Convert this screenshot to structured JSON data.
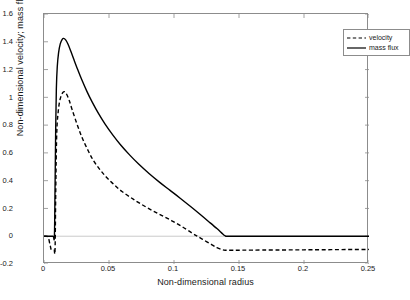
{
  "chart_data": {
    "type": "line",
    "title": "",
    "xlabel": "Non-dimensional radius",
    "ylabel": "Non-dimensional velocity; mass flux",
    "xlim": [
      0,
      0.25
    ],
    "ylim": [
      -0.2,
      1.6
    ],
    "xticks": [
      "0",
      "0.05",
      "0.1",
      "0.15",
      "0.2",
      "0.25"
    ],
    "xtick_values": [
      0,
      0.05,
      0.1,
      0.15,
      0.2,
      0.25
    ],
    "yticks": [
      "1.6",
      "1.4",
      "1.2",
      "1",
      "0.8",
      "0.6",
      "0.4",
      "0.2",
      "0",
      "-0.2"
    ],
    "ytick_values": [
      1.6,
      1.4,
      1.2,
      1,
      0.8,
      0.6,
      0.4,
      0.2,
      0,
      -0.2
    ],
    "grid": false,
    "legend_position": "top-right",
    "series": [
      {
        "name": "velocity",
        "style": "dashed",
        "color": "#000000",
        "points": [
          [
            0.0,
            0.0
          ],
          [
            0.003,
            -0.005
          ],
          [
            0.0045,
            -0.055
          ],
          [
            0.0055,
            -0.095
          ],
          [
            0.0065,
            -0.1
          ],
          [
            0.0078,
            -0.1
          ],
          [
            0.0085,
            -0.098
          ],
          [
            0.009,
            0.3
          ],
          [
            0.0095,
            0.62
          ],
          [
            0.01,
            0.79
          ],
          [
            0.0108,
            0.885
          ],
          [
            0.0118,
            0.96
          ],
          [
            0.013,
            1.005
          ],
          [
            0.0145,
            1.035
          ],
          [
            0.016,
            1.04
          ],
          [
            0.0175,
            1.02
          ],
          [
            0.0195,
            0.975
          ],
          [
            0.0215,
            0.915
          ],
          [
            0.024,
            0.845
          ],
          [
            0.027,
            0.765
          ],
          [
            0.03,
            0.695
          ],
          [
            0.034,
            0.615
          ],
          [
            0.038,
            0.545
          ],
          [
            0.043,
            0.48
          ],
          [
            0.048,
            0.425
          ],
          [
            0.054,
            0.37
          ],
          [
            0.06,
            0.322
          ],
          [
            0.067,
            0.277
          ],
          [
            0.074,
            0.235
          ],
          [
            0.082,
            0.192
          ],
          [
            0.09,
            0.152
          ],
          [
            0.098,
            0.113
          ],
          [
            0.106,
            0.07
          ],
          [
            0.114,
            0.022
          ],
          [
            0.118,
            0.0
          ],
          [
            0.122,
            -0.022
          ],
          [
            0.128,
            -0.055
          ],
          [
            0.133,
            -0.082
          ],
          [
            0.137,
            -0.097
          ],
          [
            0.1395,
            -0.101
          ],
          [
            0.143,
            -0.101
          ],
          [
            0.16,
            -0.1
          ],
          [
            0.2,
            -0.098
          ],
          [
            0.25,
            -0.095
          ]
        ]
      },
      {
        "name": "mass flux",
        "style": "solid",
        "color": "#000000",
        "points": [
          [
            0.0,
            0.0
          ],
          [
            0.004,
            0.0
          ],
          [
            0.007,
            0.0
          ],
          [
            0.008,
            0.0
          ],
          [
            0.0085,
            0.35
          ],
          [
            0.009,
            0.78
          ],
          [
            0.0095,
            1.06
          ],
          [
            0.0102,
            1.22
          ],
          [
            0.0112,
            1.32
          ],
          [
            0.0125,
            1.385
          ],
          [
            0.014,
            1.418
          ],
          [
            0.0152,
            1.424
          ],
          [
            0.0168,
            1.412
          ],
          [
            0.0185,
            1.382
          ],
          [
            0.0205,
            1.335
          ],
          [
            0.023,
            1.272
          ],
          [
            0.026,
            1.198
          ],
          [
            0.029,
            1.128
          ],
          [
            0.033,
            1.043
          ],
          [
            0.037,
            0.967
          ],
          [
            0.042,
            0.882
          ],
          [
            0.047,
            0.807
          ],
          [
            0.053,
            0.728
          ],
          [
            0.059,
            0.657
          ],
          [
            0.066,
            0.584
          ],
          [
            0.073,
            0.518
          ],
          [
            0.081,
            0.45
          ],
          [
            0.089,
            0.388
          ],
          [
            0.097,
            0.33
          ],
          [
            0.105,
            0.272
          ],
          [
            0.113,
            0.212
          ],
          [
            0.12,
            0.158
          ],
          [
            0.127,
            0.103
          ],
          [
            0.133,
            0.055
          ],
          [
            0.1375,
            0.016
          ],
          [
            0.1395,
            0.002
          ],
          [
            0.142,
            0.0
          ],
          [
            0.16,
            0.0
          ],
          [
            0.2,
            0.0
          ],
          [
            0.25,
            0.0
          ]
        ]
      }
    ],
    "annotations": {
      "velocity_peak": 1.04,
      "mass_flux_peak": 1.424,
      "velocity_plateau": -0.1,
      "mass_flux_plateau": 0.0,
      "transition_radius": 0.139
    }
  },
  "legend": {
    "items": [
      {
        "label": "velocity",
        "style": "dashed"
      },
      {
        "label": "mass flux",
        "style": "solid"
      }
    ]
  }
}
